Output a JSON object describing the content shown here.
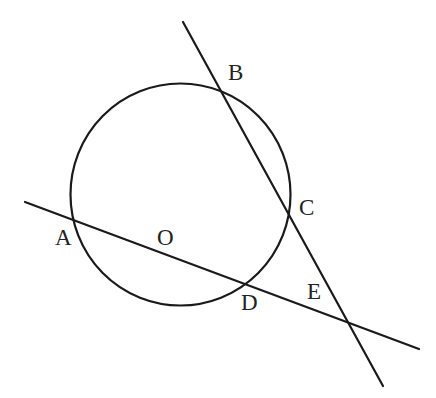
{
  "diagram": {
    "width": 436,
    "height": 398,
    "stroke_color": "#1a1a1a",
    "label_color": "#222222",
    "circle": {
      "name": "O",
      "cx": 180.5,
      "cy": 194.5,
      "rx": 110,
      "ry": 111
    },
    "lines": [
      {
        "name": "line-ADE",
        "passes_through": [
          "A",
          "O",
          "D",
          "E"
        ],
        "x1": 25,
        "y1": 202,
        "x2": 419,
        "y2": 349
      },
      {
        "name": "line-BCE",
        "passes_through": [
          "B",
          "C",
          "E"
        ],
        "x1": 183,
        "y1": 22,
        "x2": 383,
        "y2": 386
      }
    ],
    "points": [
      {
        "label": "A",
        "x": 72,
        "y": 220,
        "label_x": 55,
        "label_y": 245
      },
      {
        "label": "O",
        "x": 180,
        "y": 195,
        "label_x": 157,
        "label_y": 245
      },
      {
        "label": "B",
        "x": 221,
        "y": 91,
        "label_x": 228,
        "label_y": 80
      },
      {
        "label": "C",
        "x": 289,
        "y": 211,
        "label_x": 299,
        "label_y": 215
      },
      {
        "label": "D",
        "x": 245,
        "y": 285,
        "label_x": 241,
        "label_y": 310
      },
      {
        "label": "E",
        "x": 349,
        "y": 323,
        "label_x": 307,
        "label_y": 299
      }
    ],
    "labels": {
      "A": "A",
      "O": "O",
      "B": "B",
      "C": "C",
      "D": "D",
      "E": "E"
    }
  }
}
